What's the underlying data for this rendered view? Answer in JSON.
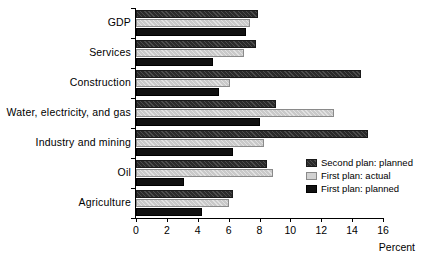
{
  "chart_data": {
    "type": "bar",
    "orientation": "horizontal",
    "title": "",
    "xlabel": "Percent",
    "ylabel": "",
    "xlim": [
      0,
      16
    ],
    "xticks": [
      0,
      2,
      4,
      6,
      8,
      10,
      12,
      14,
      16
    ],
    "xtick_labels": [
      "0",
      "2",
      "4",
      "6",
      "8",
      "10",
      "12",
      "14",
      "16"
    ],
    "grid": false,
    "legend_position": "center-right",
    "categories": [
      "GDP",
      "Services",
      "Construction",
      "Water, electricity, and gas",
      "Industry and mining",
      "Oil",
      "Agriculture"
    ],
    "series": [
      {
        "name": "Second plan: planned",
        "color": "#2b2b2b",
        "pattern": "dark-hatched",
        "values": [
          7.9,
          7.8,
          14.6,
          9.1,
          15.0,
          8.5,
          6.3
        ]
      },
      {
        "name": "First plan: actual",
        "color": "#c9c9c9",
        "pattern": "light-gray",
        "values": [
          7.4,
          7.0,
          6.1,
          12.8,
          8.3,
          8.9,
          6.0
        ]
      },
      {
        "name": "First plan: planned",
        "color": "#111111",
        "pattern": "solid-black",
        "values": [
          7.1,
          5.0,
          5.4,
          8.0,
          6.3,
          3.1,
          4.3
        ]
      }
    ]
  }
}
